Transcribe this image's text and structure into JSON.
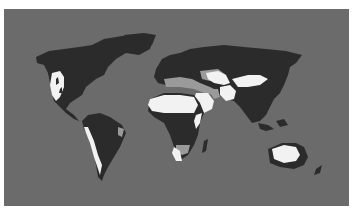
{
  "map": {
    "type": "world-map",
    "projection": "equirectangular",
    "style": "grayscale",
    "colors": {
      "background": "#ffffff",
      "ocean": "#6b6b6b",
      "land_humid": "#2b2b2b",
      "semi_arid": "#9a9a9a",
      "desert": "#f2f2f2"
    },
    "legend": [],
    "labels": []
  }
}
